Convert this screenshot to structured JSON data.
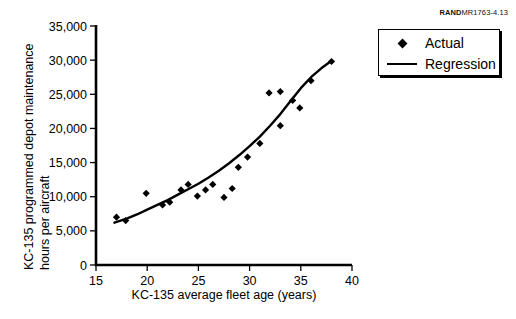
{
  "source_note": {
    "brand": "RAND",
    "code": "MR1763-4.13"
  },
  "legend": {
    "position": "top-right",
    "items": [
      {
        "label": "Actual",
        "marker": "diamond",
        "icon": "diamond-marker-icon"
      },
      {
        "label": "Regression",
        "marker": "line",
        "icon": "line-marker-icon"
      }
    ]
  },
  "axis_labels": {
    "y_line1": "KC-135 programmed depot maintenance",
    "y_line2": "hours per aircraft",
    "x": "KC-135 average fleet age (years)"
  },
  "chart_data": {
    "type": "scatter",
    "title": "",
    "xlabel": "KC-135 average fleet age (years)",
    "ylabel": "KC-135 programmed depot maintenance hours per aircraft",
    "xlim": [
      15,
      40
    ],
    "ylim": [
      0,
      35000
    ],
    "xticks": [
      15,
      20,
      25,
      30,
      35,
      40
    ],
    "yticks": [
      0,
      5000,
      10000,
      15000,
      20000,
      25000,
      30000,
      35000
    ],
    "xtick_labels": [
      "15",
      "20",
      "25",
      "30",
      "35",
      "40"
    ],
    "ytick_labels": [
      "0",
      "5,000",
      "10,000",
      "15,000",
      "20,000",
      "25,000",
      "30,000",
      "35,000"
    ],
    "grid": false,
    "legend_position": "upper right outside",
    "series": [
      {
        "name": "Actual",
        "type": "scatter",
        "marker": "diamond",
        "color": "#000000",
        "points": [
          [
            17.0,
            7000
          ],
          [
            17.9,
            6500
          ],
          [
            19.9,
            10500
          ],
          [
            21.5,
            8800
          ],
          [
            22.2,
            9200
          ],
          [
            23.3,
            11000
          ],
          [
            24.0,
            11800
          ],
          [
            24.9,
            10100
          ],
          [
            25.7,
            11000
          ],
          [
            26.4,
            11800
          ],
          [
            27.5,
            9900
          ],
          [
            28.3,
            11200
          ],
          [
            28.9,
            14300
          ],
          [
            29.8,
            15800
          ],
          [
            31.0,
            17800
          ],
          [
            31.9,
            25200
          ],
          [
            33.0,
            25400
          ],
          [
            33.0,
            20400
          ],
          [
            34.2,
            24100
          ],
          [
            34.9,
            23000
          ],
          [
            36.0,
            27000
          ],
          [
            38.0,
            29800
          ]
        ]
      },
      {
        "name": "Regression",
        "type": "line",
        "color": "#000000",
        "points": [
          [
            16.8,
            6200
          ],
          [
            18.0,
            6800
          ],
          [
            19.0,
            7400
          ],
          [
            20.0,
            8100
          ],
          [
            21.0,
            8800
          ],
          [
            22.0,
            9500
          ],
          [
            23.0,
            10300
          ],
          [
            24.0,
            11100
          ],
          [
            25.0,
            11900
          ],
          [
            26.0,
            12800
          ],
          [
            27.0,
            13800
          ],
          [
            28.0,
            14900
          ],
          [
            29.0,
            16100
          ],
          [
            30.0,
            17400
          ],
          [
            31.0,
            18800
          ],
          [
            32.0,
            20400
          ],
          [
            33.0,
            22100
          ],
          [
            34.0,
            24000
          ],
          [
            35.0,
            25900
          ],
          [
            36.0,
            27500
          ],
          [
            37.0,
            28800
          ],
          [
            38.0,
            29900
          ]
        ]
      }
    ]
  }
}
